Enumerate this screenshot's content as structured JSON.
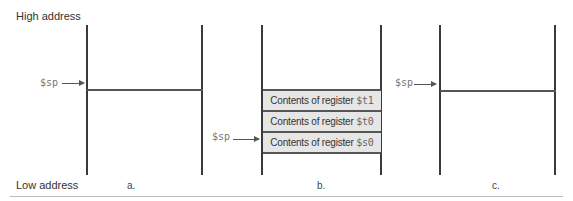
{
  "labels": {
    "high_address": "High address",
    "low_address": "Low address"
  },
  "stack_pointer_label": "$sp",
  "panels": [
    {
      "caption": "a.",
      "sp_pointer": "$sp"
    },
    {
      "caption": "b.",
      "sp_pointer": "$sp",
      "stack_entries": [
        {
          "text": "Contents of register ",
          "reg": "$t1"
        },
        {
          "text": "Contents of register ",
          "reg": "$t0"
        },
        {
          "text": "Contents of register ",
          "reg": "$s0"
        }
      ]
    },
    {
      "caption": "c.",
      "sp_pointer": "$sp"
    }
  ],
  "colors": {
    "line": "#3a3a3a",
    "entry_fill": "#e6e6e6"
  }
}
